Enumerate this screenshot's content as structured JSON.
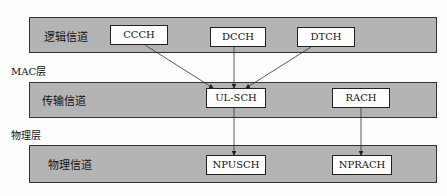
{
  "layers": {
    "mac": "MAC层",
    "phy": "物理层"
  },
  "bands": [
    "逻辑信道",
    "传输信道",
    "物理信道"
  ],
  "logical": [
    "CCCH",
    "DCCH",
    "DTCH"
  ],
  "transport": [
    "UL-SCH",
    "RACH"
  ],
  "physical": [
    "NPUSCH",
    "NPRACH"
  ]
}
